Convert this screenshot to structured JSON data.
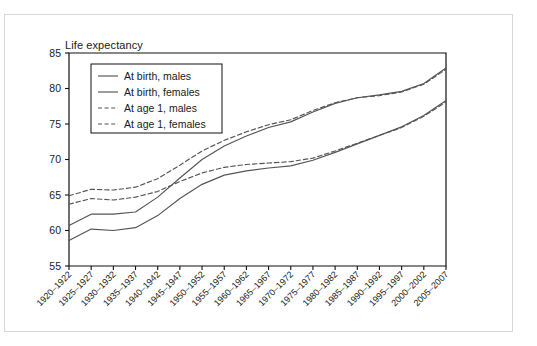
{
  "figure": {
    "title": "Life expectancy",
    "border_color": "#d8d8d8"
  },
  "chart_data": {
    "type": "line",
    "title": "Life expectancy",
    "xlabel": "",
    "ylabel": "Life expectancy",
    "ylim": [
      55,
      85
    ],
    "yticks": [
      55,
      60,
      65,
      70,
      75,
      80,
      85
    ],
    "grid": false,
    "legend_position": "top-left inside plot",
    "categories": [
      "1920–1922",
      "1925–1927",
      "1930–1932",
      "1935–1937",
      "1940–1942",
      "1945–1947",
      "1950–1952",
      "1955–1957",
      "1960–1962",
      "1965–1967",
      "1970–1972",
      "1975–1977",
      "1980–1982",
      "1985–1987",
      "1990–1992",
      "1995–1997",
      "2000–2002",
      "2005–2007"
    ],
    "series": [
      {
        "name": "At birth, males",
        "style": "solid",
        "color": "#555555",
        "values": [
          58.6,
          60.2,
          60.0,
          60.4,
          62.1,
          64.5,
          66.5,
          67.8,
          68.4,
          68.8,
          69.1,
          69.9,
          71.0,
          72.2,
          73.4,
          74.6,
          76.2,
          78.3
        ]
      },
      {
        "name": "At birth, females",
        "style": "solid",
        "color": "#555555",
        "values": [
          60.7,
          62.3,
          62.3,
          62.6,
          64.7,
          67.4,
          70.0,
          71.9,
          73.3,
          74.5,
          75.3,
          76.7,
          77.9,
          78.7,
          79.1,
          79.6,
          80.7,
          82.9
        ]
      },
      {
        "name": "At age 1, males",
        "style": "dashed",
        "color": "#555555",
        "values": [
          63.7,
          64.5,
          64.3,
          64.7,
          65.5,
          66.9,
          68.1,
          68.9,
          69.3,
          69.5,
          69.7,
          70.2,
          71.2,
          72.3,
          73.4,
          74.5,
          76.1,
          78.1
        ]
      },
      {
        "name": "At age 1, females",
        "style": "dashed",
        "color": "#555555",
        "values": [
          64.9,
          65.8,
          65.7,
          66.1,
          67.3,
          69.2,
          71.2,
          72.7,
          73.9,
          74.9,
          75.6,
          76.9,
          78.0,
          78.7,
          79.0,
          79.5,
          80.6,
          82.7
        ]
      }
    ]
  },
  "legend": {
    "items": [
      {
        "label": "At birth, males",
        "style": "solid"
      },
      {
        "label": "At birth, females",
        "style": "solid"
      },
      {
        "label": "At age 1, males",
        "style": "dashed"
      },
      {
        "label": "At age 1, females",
        "style": "dashed"
      }
    ]
  }
}
